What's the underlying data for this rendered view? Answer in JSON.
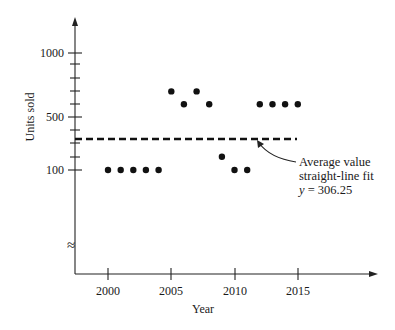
{
  "chart_data": {
    "type": "scatter",
    "title": "",
    "xlabel": "Year",
    "ylabel": "Units sold",
    "x_ticks": [
      "2000",
      "2005",
      "2010",
      "2015"
    ],
    "y_ticks": [
      "100",
      "500",
      "1000"
    ],
    "y_axis_break": true,
    "grid": false,
    "legend": null,
    "series": [
      {
        "name": "Units sold",
        "x": [
          2000,
          2001,
          2002,
          2003,
          2004,
          2005,
          2006,
          2007,
          2008,
          2009,
          2010,
          2011,
          2012,
          2013,
          2014,
          2015
        ],
        "y": [
          100,
          100,
          100,
          100,
          100,
          700,
          600,
          700,
          600,
          200,
          100,
          100,
          600,
          600,
          600,
          600
        ]
      }
    ],
    "reference_line": {
      "style": "dashed",
      "value": 306.25,
      "x_range": [
        1997.5,
        2015
      ]
    },
    "annotations": [
      {
        "text": "Average value",
        "line": 1
      },
      {
        "text": "straight-line fit",
        "line": 2
      },
      {
        "text": "y = 306.25",
        "line": 3
      }
    ]
  },
  "labels": {
    "xlabel": "Year",
    "ylabel": "Units sold",
    "xticks": [
      "2000",
      "2005",
      "2010",
      "2015"
    ],
    "yticks": [
      "1000",
      "500",
      "100"
    ],
    "annot1": "Average value",
    "annot2": "straight-line fit",
    "annot3_var": "y",
    "annot3_rest": " = 306.25",
    "break_symbol": "≈"
  }
}
